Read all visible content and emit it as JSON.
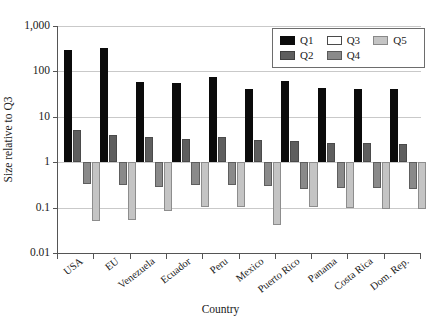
{
  "chart_data": {
    "type": "bar",
    "title": "",
    "xlabel": "Country",
    "ylabel": "Size relative to Q3",
    "yscale": "log",
    "ylim": [
      0.01,
      1000
    ],
    "ytick_labels": [
      "1,000",
      "100",
      "10",
      "1",
      "0.1",
      "0.01"
    ],
    "ytick_values": [
      1000,
      100,
      10,
      1,
      0.1,
      0.01
    ],
    "grid": true,
    "baseline": 1,
    "legend_position": "top-right",
    "categories": [
      "USA",
      "EU",
      "Venezuela",
      "Ecuador",
      "Peru",
      "Mexico",
      "Puerto Rico",
      "Panama",
      "Costa Rica",
      "Dom. Rep."
    ],
    "series": [
      {
        "name": "Q1",
        "color": "#0b0b0b",
        "values": [
          300,
          330,
          58,
          55,
          75,
          40,
          60,
          43,
          40,
          42
        ]
      },
      {
        "name": "Q2",
        "color": "#5e5e5e",
        "values": [
          5.2,
          3.9,
          3.5,
          3.2,
          3.5,
          3.1,
          2.9,
          2.7,
          2.6,
          2.5
        ]
      },
      {
        "name": "Q3",
        "color": "#ffffff",
        "values": [
          1,
          1,
          1,
          1,
          1,
          1,
          1,
          1,
          1,
          1
        ]
      },
      {
        "name": "Q4",
        "color": "#8a8a8a",
        "values": [
          0.33,
          0.31,
          0.29,
          0.31,
          0.31,
          0.3,
          0.26,
          0.27,
          0.27,
          0.26
        ]
      },
      {
        "name": "Q5",
        "color": "#c4c4c4",
        "values": [
          0.05,
          0.052,
          0.085,
          0.105,
          0.105,
          0.042,
          0.105,
          0.1,
          0.095,
          0.095
        ]
      }
    ]
  },
  "legend": {
    "items": [
      {
        "label": "Q1",
        "swatch": "q1"
      },
      {
        "label": "Q3",
        "swatch": "q3"
      },
      {
        "label": "Q5",
        "swatch": "q5"
      },
      {
        "label": "Q2",
        "swatch": "q2"
      },
      {
        "label": "Q4",
        "swatch": "q4"
      }
    ]
  }
}
